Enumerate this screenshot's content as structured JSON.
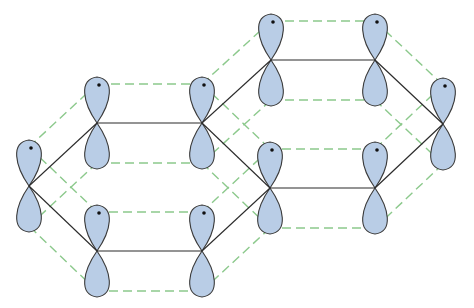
{
  "diagram": {
    "colors": {
      "lobe_fill": "#b9cde6",
      "lobe_stroke": "#3a3a3a",
      "bond": "#2b2b2b",
      "overlap_dash": "#8cc98c",
      "dot": "#111111"
    },
    "lobe": {
      "half_width": 16,
      "length": 46,
      "upper_offset": -39,
      "lower_offset": 40
    },
    "atoms": [
      {
        "id": "A",
        "x": 29,
        "y": 186
      },
      {
        "id": "B",
        "x": 97,
        "y": 123
      },
      {
        "id": "C",
        "x": 202,
        "y": 123
      },
      {
        "id": "D",
        "x": 270,
        "y": 188
      },
      {
        "id": "E",
        "x": 202,
        "y": 251
      },
      {
        "id": "F",
        "x": 97,
        "y": 251
      },
      {
        "id": "G",
        "x": 271,
        "y": 60
      },
      {
        "id": "H",
        "x": 375,
        "y": 60
      },
      {
        "id": "I",
        "x": 443,
        "y": 124
      },
      {
        "id": "K",
        "x": 375,
        "y": 188
      }
    ],
    "bonds": [
      [
        "A",
        "B"
      ],
      [
        "B",
        "C"
      ],
      [
        "C",
        "D"
      ],
      [
        "D",
        "E"
      ],
      [
        "E",
        "F"
      ],
      [
        "F",
        "A"
      ],
      [
        "C",
        "G"
      ],
      [
        "G",
        "H"
      ],
      [
        "H",
        "I"
      ],
      [
        "I",
        "K"
      ],
      [
        "K",
        "D"
      ]
    ]
  }
}
